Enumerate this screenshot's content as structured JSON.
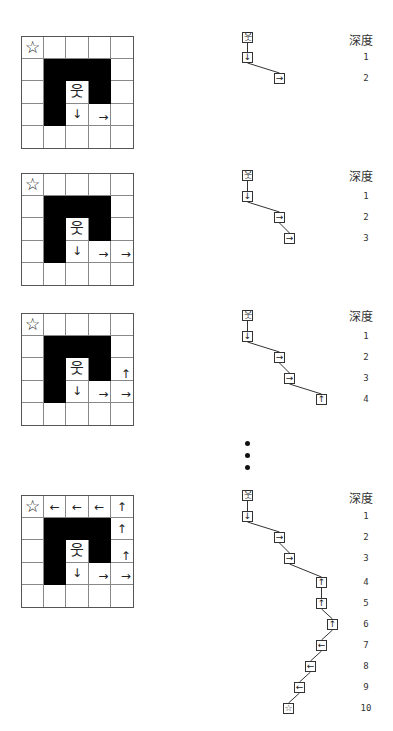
{
  "legend": {
    "depth_label": "深度"
  },
  "icons": {
    "goal": "☆",
    "start": "웃",
    "up": "↑",
    "down": "↓",
    "left": "←",
    "right": "→"
  },
  "maze": {
    "size": 5,
    "walls": [
      [
        1,
        1
      ],
      [
        1,
        2
      ],
      [
        1,
        3
      ],
      [
        2,
        1
      ],
      [
        2,
        3
      ],
      [
        3,
        1
      ]
    ],
    "goal_cell": [
      0,
      0
    ],
    "start_cell": [
      2,
      2
    ]
  },
  "ellipsis": "⋮",
  "panels": [
    {
      "grid_top": 36,
      "moves": [
        {
          "cell": [
            3,
            2
          ],
          "dir": "down"
        },
        {
          "cell": [
            3,
            3
          ],
          "dir": "right"
        }
      ],
      "tree": {
        "nodes": [
          {
            "depth": 0,
            "icon": "start",
            "x": 242,
            "y": 32
          },
          {
            "depth": 1,
            "icon": "down",
            "x": 242,
            "y": 52
          },
          {
            "depth": 2,
            "icon": "right",
            "x": 274,
            "y": 73
          }
        ]
      },
      "depth_header_y": 31,
      "depth_numbers": [
        {
          "label": "1",
          "y": 52
        },
        {
          "label": "2",
          "y": 73
        }
      ]
    },
    {
      "grid_top": 173,
      "moves": [
        {
          "cell": [
            3,
            2
          ],
          "dir": "down"
        },
        {
          "cell": [
            3,
            3
          ],
          "dir": "right"
        },
        {
          "cell": [
            3,
            4
          ],
          "dir": "right"
        }
      ],
      "tree": {
        "nodes": [
          {
            "depth": 0,
            "icon": "start",
            "x": 242,
            "y": 170
          },
          {
            "depth": 1,
            "icon": "down",
            "x": 242,
            "y": 191
          },
          {
            "depth": 2,
            "icon": "right",
            "x": 274,
            "y": 212
          },
          {
            "depth": 3,
            "icon": "right",
            "x": 284,
            "y": 233
          }
        ]
      },
      "depth_header_y": 167,
      "depth_numbers": [
        {
          "label": "1",
          "y": 191
        },
        {
          "label": "2",
          "y": 212
        },
        {
          "label": "3",
          "y": 233
        }
      ]
    },
    {
      "grid_top": 313,
      "moves": [
        {
          "cell": [
            3,
            2
          ],
          "dir": "down"
        },
        {
          "cell": [
            3,
            3
          ],
          "dir": "right"
        },
        {
          "cell": [
            3,
            4
          ],
          "dir": "right"
        },
        {
          "cell": [
            2,
            4
          ],
          "dir": "up"
        }
      ],
      "tree": {
        "nodes": [
          {
            "depth": 0,
            "icon": "start",
            "x": 242,
            "y": 310
          },
          {
            "depth": 1,
            "icon": "down",
            "x": 242,
            "y": 331
          },
          {
            "depth": 2,
            "icon": "right",
            "x": 274,
            "y": 352
          },
          {
            "depth": 3,
            "icon": "right",
            "x": 284,
            "y": 373
          },
          {
            "depth": 4,
            "icon": "up",
            "x": 316,
            "y": 394
          }
        ]
      },
      "depth_header_y": 307,
      "depth_numbers": [
        {
          "label": "1",
          "y": 331
        },
        {
          "label": "2",
          "y": 352
        },
        {
          "label": "3",
          "y": 373
        },
        {
          "label": "4",
          "y": 394
        }
      ]
    },
    {
      "grid_top": 495,
      "moves": [
        {
          "cell": [
            3,
            2
          ],
          "dir": "down"
        },
        {
          "cell": [
            3,
            3
          ],
          "dir": "right"
        },
        {
          "cell": [
            3,
            4
          ],
          "dir": "right"
        },
        {
          "cell": [
            2,
            4
          ],
          "dir": "up"
        },
        {
          "cell": [
            1,
            4
          ],
          "dir": "up"
        },
        {
          "cell": [
            0,
            4
          ],
          "dir": "up"
        },
        {
          "cell": [
            0,
            3
          ],
          "dir": "left"
        },
        {
          "cell": [
            0,
            2
          ],
          "dir": "left"
        },
        {
          "cell": [
            0,
            1
          ],
          "dir": "left"
        }
      ],
      "tree": {
        "nodes": [
          {
            "depth": 0,
            "icon": "start",
            "x": 242,
            "y": 490
          },
          {
            "depth": 1,
            "icon": "down",
            "x": 242,
            "y": 511
          },
          {
            "depth": 2,
            "icon": "right",
            "x": 274,
            "y": 532
          },
          {
            "depth": 3,
            "icon": "right",
            "x": 284,
            "y": 553
          },
          {
            "depth": 4,
            "icon": "up",
            "x": 316,
            "y": 577
          },
          {
            "depth": 5,
            "icon": "up",
            "x": 316,
            "y": 598
          },
          {
            "depth": 6,
            "icon": "up",
            "x": 327,
            "y": 619
          },
          {
            "depth": 7,
            "icon": "left",
            "x": 316,
            "y": 640
          },
          {
            "depth": 8,
            "icon": "left",
            "x": 305,
            "y": 661
          },
          {
            "depth": 9,
            "icon": "left",
            "x": 294,
            "y": 682
          },
          {
            "depth": 10,
            "icon": "goal",
            "x": 283,
            "y": 703
          }
        ]
      },
      "depth_header_y": 489,
      "depth_numbers": [
        {
          "label": "1",
          "y": 511
        },
        {
          "label": "2",
          "y": 532
        },
        {
          "label": "3",
          "y": 553
        },
        {
          "label": "4",
          "y": 577
        },
        {
          "label": "5",
          "y": 598
        },
        {
          "label": "6",
          "y": 619
        },
        {
          "label": "7",
          "y": 640
        },
        {
          "label": "8",
          "y": 661
        },
        {
          "label": "9",
          "y": 682
        },
        {
          "label": "10",
          "y": 703
        }
      ]
    }
  ],
  "ellipsis_dots_y": [
    441,
    453,
    465
  ]
}
